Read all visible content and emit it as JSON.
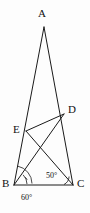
{
  "figure": {
    "background_color": "#fdfdfd",
    "stroke_color": "#1a1a1a",
    "width": 90,
    "height": 213,
    "vertices": [
      {
        "name": "A",
        "label": "A",
        "x": 44,
        "y": 27,
        "label_x": 38,
        "label_y": 8
      },
      {
        "name": "B",
        "label": "B",
        "x": 14,
        "y": 185,
        "label_x": 2,
        "label_y": 178
      },
      {
        "name": "C",
        "label": "C",
        "x": 73,
        "y": 185,
        "label_x": 77,
        "label_y": 178
      },
      {
        "name": "D",
        "label": "D",
        "x": 64,
        "y": 114,
        "label_x": 68,
        "label_y": 104
      },
      {
        "name": "E",
        "label": "E",
        "x": 26,
        "y": 131,
        "label_x": 13,
        "label_y": 124
      }
    ],
    "segments": [
      {
        "name": "side-AB",
        "from": "A",
        "to": "B"
      },
      {
        "name": "side-AC",
        "from": "A",
        "to": "C"
      },
      {
        "name": "side-BC",
        "from": "B",
        "to": "C"
      },
      {
        "name": "cevian-BD",
        "from": "B",
        "to": "D"
      },
      {
        "name": "cevian-EC",
        "from": "E",
        "to": "C"
      },
      {
        "name": "segment-ED",
        "from": "E",
        "to": "D"
      }
    ],
    "angles": [
      {
        "name": "angle-DBC",
        "value": "50°",
        "at_vertex": "B",
        "label_x": 46,
        "label_y": 172
      },
      {
        "name": "angle-ABC",
        "value": "60°",
        "at_vertex": "B",
        "label_x": 21,
        "label_y": 194
      }
    ]
  }
}
